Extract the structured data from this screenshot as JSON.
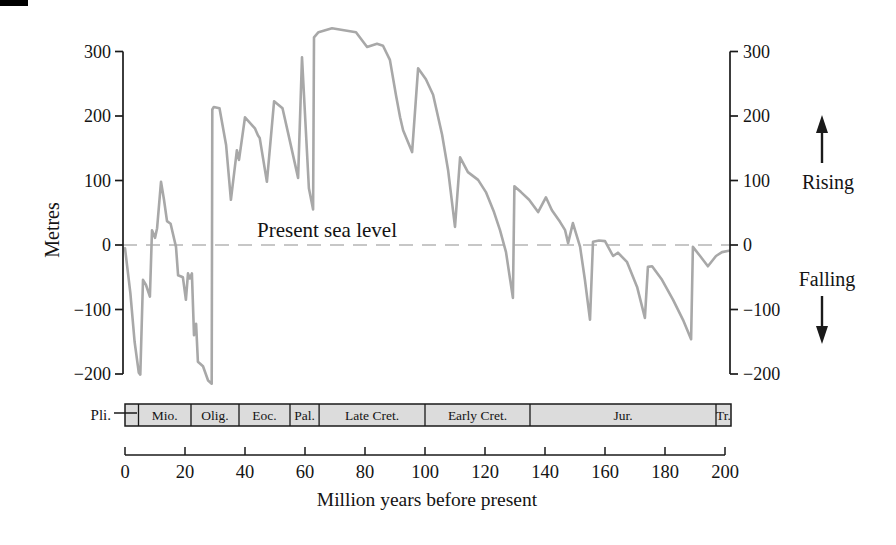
{
  "figure": {
    "metres_label": "Metres",
    "sea_level_label": "Present sea level",
    "rising_label": "Rising",
    "falling_label": "Falling",
    "x_axis_title": "Million years before present",
    "pliocene_label": "Pli."
  },
  "colors": {
    "curve": "#a8a8a8",
    "dashed_zero": "#b5b5b5",
    "axis": "#1a1a1a",
    "band_fill": "#dcdcdc",
    "band_border": "#1a1a1a",
    "text": "#141414",
    "background": "#ffffff"
  },
  "chart_data": {
    "type": "line",
    "xlabel": "Million years before present",
    "ylabel": "Metres",
    "x_unit": "Ma",
    "y_unit": "m",
    "xlim": [
      0,
      200
    ],
    "ylim": [
      -200,
      300
    ],
    "grid": false,
    "zero_line": {
      "value": 0,
      "style": "dashed",
      "label": "Present sea level"
    },
    "right_axis_annotations": [
      {
        "label": "Rising",
        "direction": "up"
      },
      {
        "label": "Falling",
        "direction": "down"
      }
    ],
    "x_ticks": [
      0,
      20,
      40,
      60,
      80,
      100,
      120,
      140,
      160,
      180,
      200
    ],
    "y_ticks": [
      {
        "value": 300,
        "label": "300"
      },
      {
        "value": 200,
        "label": "200"
      },
      {
        "value": 100,
        "label": "100"
      },
      {
        "value": 0,
        "label": "0"
      },
      {
        "value": -100,
        "label": "−100"
      },
      {
        "value": -200,
        "label": "−200"
      }
    ],
    "series": [
      {
        "name": "Sea level (metres) vs time (Ma before present)",
        "points": [
          [
            0,
            -5
          ],
          [
            1.8,
            -75
          ],
          [
            3.2,
            -150
          ],
          [
            4.6,
            -198
          ],
          [
            5.1,
            -201
          ],
          [
            6,
            -54
          ],
          [
            7,
            -62
          ],
          [
            8.3,
            -80
          ],
          [
            9,
            23
          ],
          [
            10,
            11
          ],
          [
            10.7,
            26
          ],
          [
            12,
            98
          ],
          [
            13,
            70
          ],
          [
            14,
            37
          ],
          [
            15.2,
            33
          ],
          [
            17,
            -3
          ],
          [
            17.7,
            -47
          ],
          [
            19.3,
            -50
          ],
          [
            20.3,
            -85
          ],
          [
            21,
            -44
          ],
          [
            21.6,
            -52
          ],
          [
            22.3,
            -44
          ],
          [
            23,
            -140
          ],
          [
            23.7,
            -122
          ],
          [
            24.3,
            -181
          ],
          [
            26,
            -188
          ],
          [
            27.7,
            -210
          ],
          [
            28.9,
            -215
          ],
          [
            29.1,
            210
          ],
          [
            29.6,
            214
          ],
          [
            31.5,
            212
          ],
          [
            33.7,
            155
          ],
          [
            35.3,
            70
          ],
          [
            37.3,
            147
          ],
          [
            38,
            132
          ],
          [
            40,
            198
          ],
          [
            43.3,
            181
          ],
          [
            44.3,
            170
          ],
          [
            44.9,
            166
          ],
          [
            47.3,
            98
          ],
          [
            49.7,
            223
          ],
          [
            51,
            218
          ],
          [
            52.5,
            212
          ],
          [
            54.3,
            175
          ],
          [
            57.7,
            104
          ],
          [
            59,
            291
          ],
          [
            61.3,
            88
          ],
          [
            62.7,
            55
          ],
          [
            63,
            322
          ],
          [
            64.5,
            330
          ],
          [
            69,
            336
          ],
          [
            73,
            333
          ],
          [
            77,
            330
          ],
          [
            80.7,
            307
          ],
          [
            84,
            312
          ],
          [
            86,
            309
          ],
          [
            88.3,
            287
          ],
          [
            90.3,
            233
          ],
          [
            91.7,
            198
          ],
          [
            92.7,
            178
          ],
          [
            95.7,
            144
          ],
          [
            97.7,
            274
          ],
          [
            100.3,
            257
          ],
          [
            102.7,
            233
          ],
          [
            105.7,
            171
          ],
          [
            107.7,
            116
          ],
          [
            110,
            28
          ],
          [
            111.7,
            136
          ],
          [
            114.3,
            113
          ],
          [
            117.7,
            101
          ],
          [
            120.3,
            82
          ],
          [
            123,
            51
          ],
          [
            125,
            23
          ],
          [
            127,
            -11
          ],
          [
            129.3,
            -82
          ],
          [
            129.8,
            91
          ],
          [
            132,
            82
          ],
          [
            134.7,
            70
          ],
          [
            137.7,
            51
          ],
          [
            140.3,
            74
          ],
          [
            142.3,
            54
          ],
          [
            145,
            36
          ],
          [
            146.7,
            23
          ],
          [
            147.7,
            3
          ],
          [
            149.3,
            34
          ],
          [
            151.7,
            -3
          ],
          [
            153.3,
            -54
          ],
          [
            155,
            -116
          ],
          [
            156,
            5
          ],
          [
            158,
            7
          ],
          [
            160,
            6
          ],
          [
            162.7,
            -17
          ],
          [
            164.3,
            -12
          ],
          [
            167.3,
            -26
          ],
          [
            170.7,
            -65
          ],
          [
            173.3,
            -113
          ],
          [
            174.3,
            -34
          ],
          [
            175.7,
            -33
          ],
          [
            179,
            -54
          ],
          [
            182.7,
            -85
          ],
          [
            186,
            -116
          ],
          [
            188.7,
            -146
          ],
          [
            189.3,
            -3
          ],
          [
            191.7,
            -17
          ],
          [
            194.3,
            -33
          ],
          [
            197,
            -17
          ],
          [
            199,
            -11
          ],
          [
            201.3,
            -9
          ]
        ]
      }
    ],
    "geologic_periods": [
      {
        "label": "Pli.",
        "start": 0,
        "end": 4.5,
        "label_outside": true
      },
      {
        "label": "Mio.",
        "start": 4.5,
        "end": 22
      },
      {
        "label": "Olig.",
        "start": 22,
        "end": 38
      },
      {
        "label": "Eoc.",
        "start": 38,
        "end": 55
      },
      {
        "label": "Pal.",
        "start": 55,
        "end": 64.7
      },
      {
        "label": "Late Cret.",
        "start": 64.7,
        "end": 100
      },
      {
        "label": "Early Cret.",
        "start": 100,
        "end": 135
      },
      {
        "label": "Jur.",
        "start": 135,
        "end": 197
      },
      {
        "label": "Tr.",
        "start": 197,
        "end": 202
      }
    ]
  }
}
